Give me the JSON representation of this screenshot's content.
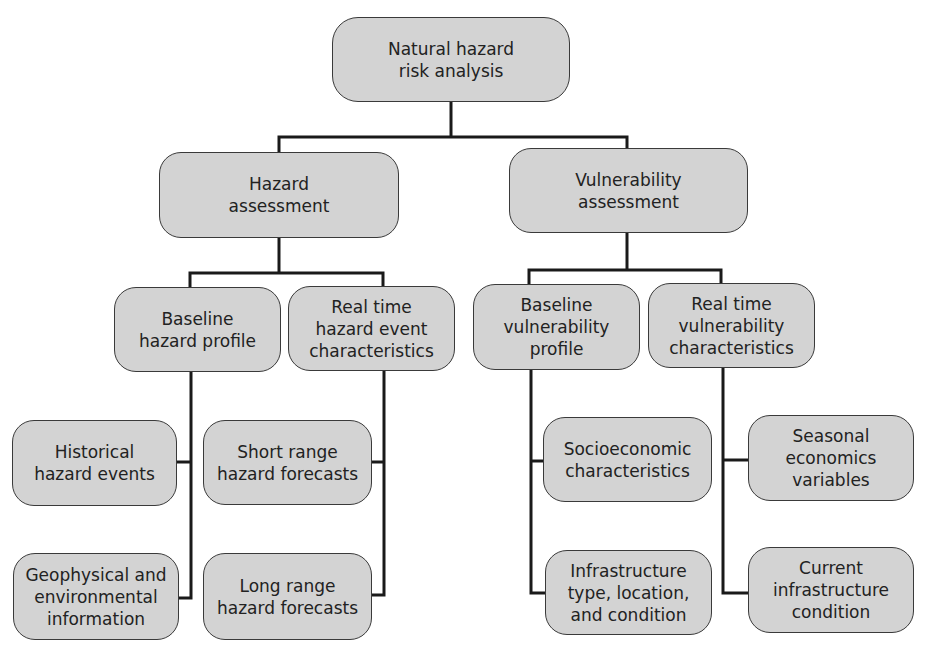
{
  "diagram": {
    "root": {
      "id": "root",
      "label": "Natural hazard\nrisk analysis"
    },
    "nodes": [
      {
        "id": "hazard",
        "label": "Hazard\nassessment",
        "parent": "root"
      },
      {
        "id": "vuln",
        "label": "Vulnerability\nassessment",
        "parent": "root"
      },
      {
        "id": "base_haz",
        "label": "Baseline\nhazard profile",
        "parent": "hazard"
      },
      {
        "id": "rt_haz",
        "label": "Real time\nhazard event\ncharacteristics",
        "parent": "hazard"
      },
      {
        "id": "base_vuln",
        "label": "Baseline\nvulnerability\nprofile",
        "parent": "vuln"
      },
      {
        "id": "rt_vuln",
        "label": "Real time\nvulnerability\ncharacteristics",
        "parent": "vuln"
      },
      {
        "id": "historical",
        "label": "Historical\nhazard events",
        "parent": "base_haz"
      },
      {
        "id": "geo",
        "label": "Geophysical and\nenvironmental\ninformation",
        "parent": "base_haz"
      },
      {
        "id": "short",
        "label": "Short range\nhazard forecasts",
        "parent": "rt_haz"
      },
      {
        "id": "long",
        "label": "Long range\nhazard forecasts",
        "parent": "rt_haz"
      },
      {
        "id": "socio",
        "label": "Socioeconomic\ncharacteristics",
        "parent": "base_vuln"
      },
      {
        "id": "infra",
        "label": "Infrastructure\ntype, location,\nand condition",
        "parent": "base_vuln"
      },
      {
        "id": "seasonal",
        "label": "Seasonal\neconomics\nvariables",
        "parent": "rt_vuln"
      },
      {
        "id": "current",
        "label": "Current\ninfrastructure\ncondition",
        "parent": "rt_vuln"
      }
    ]
  }
}
